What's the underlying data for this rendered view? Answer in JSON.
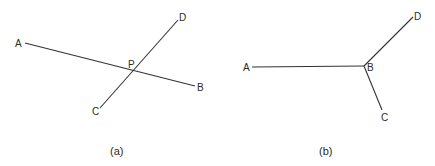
{
  "panels": [
    {
      "caption": "(a)",
      "points": {
        "A": "A",
        "B": "B",
        "C": "C",
        "D": "D",
        "P": "P"
      },
      "description": "Two straight lines AB and CD crossing at point P"
    },
    {
      "caption": "(b)",
      "points": {
        "A": "A",
        "B": "B",
        "C": "C",
        "D": "D"
      },
      "description": "Three segments BA, BD, BC meeting at junction point B"
    }
  ],
  "colors": {
    "stroke": "#333333",
    "text": "#2a2a2a",
    "background": "#ffffff"
  }
}
